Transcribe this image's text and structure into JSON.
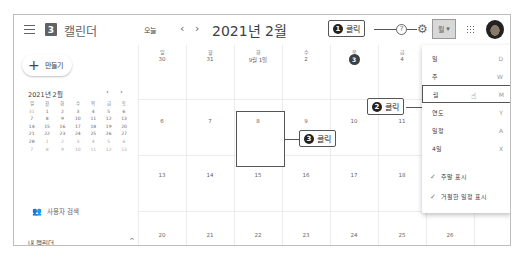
{
  "header": {
    "app_title": "캘린더",
    "logo_number": "3",
    "today_label": "오늘",
    "prev": "‹",
    "next": "›",
    "current_month": "2021년 2월",
    "view_select_label": "월",
    "view_select_caret": "▾",
    "help_icon": "?",
    "gear_icon": "⚙"
  },
  "callouts": [
    {
      "number": "1",
      "label": "클릭"
    },
    {
      "number": "2",
      "label": "클릭"
    },
    {
      "number": "3",
      "label": "클릭"
    }
  ],
  "sidebar": {
    "create_label": "만들기",
    "create_icon": "+",
    "mini_calendar": {
      "title": "2021년 2월",
      "prev": "‹",
      "next": "›",
      "weekdays": [
        "일",
        "월",
        "화",
        "수",
        "목",
        "금",
        "토"
      ],
      "weeks": [
        [
          "31",
          "1",
          "2",
          "3",
          "4",
          "5",
          "6"
        ],
        [
          "7",
          "8",
          "9",
          "10",
          "11",
          "12",
          "13"
        ],
        [
          "14",
          "15",
          "16",
          "17",
          "18",
          "19",
          "20"
        ],
        [
          "21",
          "22",
          "23",
          "24",
          "25",
          "26",
          "27"
        ],
        [
          "28",
          "1",
          "2",
          "3",
          "4",
          "5",
          "6"
        ],
        [
          "7",
          "8",
          "9",
          "10",
          "11",
          "12",
          "13"
        ]
      ]
    },
    "search_people_icon": "👥",
    "search_people_label": "사용자 검색",
    "my_calendars_label": "내 캘린더",
    "my_calendars_chevron": "^"
  },
  "month_grid": {
    "weekdays": [
      "일",
      "월",
      "화",
      "수",
      "목",
      "금",
      "토"
    ],
    "weeks": [
      [
        "30",
        "31",
        "9월 1일",
        "2",
        "3",
        "4",
        "5"
      ],
      [
        "6",
        "7",
        "8",
        "9",
        "10",
        "11",
        "12"
      ],
      [
        "13",
        "14",
        "15",
        "16",
        "17",
        "18",
        "19"
      ],
      [
        "20",
        "21",
        "22",
        "23",
        "24",
        "25",
        "26"
      ]
    ],
    "today": "3"
  },
  "view_menu": {
    "items": [
      {
        "label": "일",
        "key": "D"
      },
      {
        "label": "주",
        "key": "W"
      },
      {
        "label": "월",
        "key": "M"
      },
      {
        "label": "연도",
        "key": "Y"
      },
      {
        "label": "일정",
        "key": "A"
      },
      {
        "label": "4일",
        "key": "X"
      }
    ],
    "checks": [
      {
        "label": "주말 표시"
      },
      {
        "label": "거절한 일정 표시"
      }
    ],
    "check_icon": "✓",
    "cursor_icon": "☝"
  }
}
